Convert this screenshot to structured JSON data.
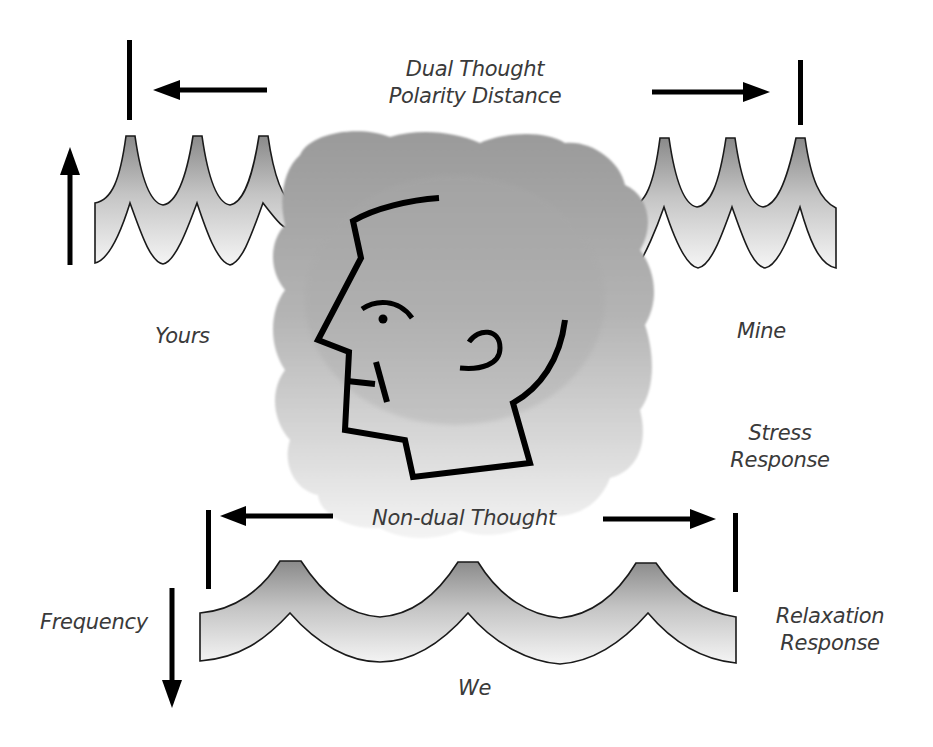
{
  "diagram": {
    "labels": {
      "dual_thought_line1": "Dual Thought",
      "dual_thought_line2": "Polarity Distance",
      "yours": "Yours",
      "mine": "Mine",
      "stress_line1": "Stress",
      "stress_line2": "Response",
      "non_dual_thought": "Non-dual Thought",
      "frequency": "Frequency",
      "relaxation_line1": "Relaxation",
      "relaxation_line2": "Response",
      "we": "We"
    },
    "elements": {
      "top_left_wave": {
        "description": "high-frequency wave (3 sharp peaks)",
        "side": "left"
      },
      "top_right_wave": {
        "description": "high-frequency wave (3 sharp peaks)",
        "side": "right"
      },
      "bottom_wave": {
        "description": "low-frequency wave (3 broad peaks)"
      },
      "center_figure": {
        "description": "profile head inside gray cloud"
      },
      "arrows": [
        {
          "id": "polarity-left",
          "direction": "left"
        },
        {
          "id": "polarity-right",
          "direction": "right"
        },
        {
          "id": "frequency-up",
          "direction": "up"
        },
        {
          "id": "non-dual-left",
          "direction": "left"
        },
        {
          "id": "non-dual-right",
          "direction": "right"
        },
        {
          "id": "frequency-down",
          "direction": "down"
        }
      ]
    },
    "colors": {
      "ink": "#000000",
      "text": "#3a3a3a",
      "wave_dark": "#8a8a8a",
      "wave_light": "#f4f4f4",
      "cloud_dark": "#9c9c9c",
      "cloud_light": "#f3f3f3"
    }
  }
}
